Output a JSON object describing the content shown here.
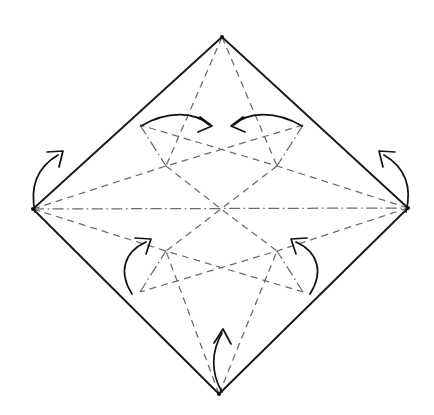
{
  "figure": {
    "kind": "origami-crease-pattern",
    "canvas": {
      "width": 434,
      "height": 415,
      "background": "#ffffff"
    },
    "colors": {
      "outline": "#1a1a1a",
      "crease": "#6b6b6b",
      "arrow": "#111111",
      "background": "#ffffff"
    },
    "line_styles": {
      "outline_label": "solid",
      "valley_label": "dashed",
      "mountain_label": "dash-dot-dot"
    }
  },
  "geometry": {
    "vertices": {
      "top": {
        "name": "top-vertex",
        "x": 222,
        "y": 37
      },
      "right": {
        "name": "right-vertex",
        "x": 408,
        "y": 208
      },
      "bottom": {
        "name": "bottom-vertex",
        "x": 219,
        "y": 394
      },
      "left": {
        "name": "left-vertex",
        "x": 33,
        "y": 209
      },
      "center": {
        "name": "center-point",
        "x": 221,
        "y": 209
      }
    },
    "edge_nodes": {
      "upper_left": {
        "name": "edge-node-upper-left",
        "x": 140,
        "y": 125
      },
      "upper_right": {
        "name": "edge-node-upper-right",
        "x": 303,
        "y": 125
      },
      "lower_left": {
        "name": "edge-node-lower-left",
        "x": 140,
        "y": 292
      },
      "lower_right": {
        "name": "edge-node-lower-right",
        "x": 303,
        "y": 292
      }
    },
    "inner_nodes": {
      "upper_left": {
        "name": "inner-node-upper-left",
        "x": 166,
        "y": 166
      },
      "upper_right": {
        "name": "inner-node-upper-right",
        "x": 277,
        "y": 166
      },
      "lower_left": {
        "name": "inner-node-lower-left",
        "x": 166,
        "y": 251
      },
      "lower_right": {
        "name": "inner-node-lower-right",
        "x": 277,
        "y": 251
      }
    }
  },
  "outline": {
    "name": "sheet-outline",
    "path": "M 222 37 L 408 208 L 219 394 L 33 209 Z"
  },
  "creases": {
    "valley": [
      {
        "name": "valley-top-to-inner-left",
        "path": "M 222 37 L 166 166"
      },
      {
        "name": "valley-top-to-inner-right",
        "path": "M 222 37 L 277 166"
      },
      {
        "name": "valley-bottom-to-inner-left",
        "path": "M 219 394 L 166 251"
      },
      {
        "name": "valley-bottom-to-inner-right",
        "path": "M 219 394 L 277 251"
      },
      {
        "name": "valley-left-upper-diagonal",
        "path": "M 33 209 L 166 166 L 303 125"
      },
      {
        "name": "valley-left-lower-diagonal",
        "path": "M 33 209 L 166 251 L 303 292"
      },
      {
        "name": "valley-right-upper-diagonal",
        "path": "M 408 208 L 277 166 L 140 125"
      },
      {
        "name": "valley-right-lower-diagonal",
        "path": "M 408 208 L 277 251 L 140 292"
      },
      {
        "name": "valley-diagonal-tl-br",
        "path": "M 166 166 L 221 209 L 277 251"
      },
      {
        "name": "valley-diagonal-tr-bl",
        "path": "M 277 166 L 221 209 L 166 251"
      }
    ],
    "mountain": [
      {
        "name": "mountain-horizontal-axis",
        "path": "M 33 209 L 408 208"
      },
      {
        "name": "mountain-edge-upper-left",
        "path": "M 140 125 L 166 166"
      },
      {
        "name": "mountain-edge-upper-right",
        "path": "M 303 125 L 277 166"
      },
      {
        "name": "mountain-edge-lower-left",
        "path": "M 140 292 L 166 251"
      },
      {
        "name": "mountain-edge-lower-right",
        "path": "M 303 292 L 277 251"
      }
    ]
  },
  "arrows": [
    {
      "name": "fold-arrow-top-left",
      "direction": "right",
      "from": "edge-node-upper-left",
      "to": "inner-upper-center",
      "arc": "M 141 126 C 168 110, 196 112, 209 125",
      "head": "M 200 117 L 212 126 L 198 132"
    },
    {
      "name": "fold-arrow-top-right",
      "direction": "left",
      "from": "edge-node-upper-right",
      "to": "inner-upper-center",
      "arc": "M 302 126 C 275 110, 247 112, 234 125",
      "head": "M 243 117 L 231 126 L 245 132"
    },
    {
      "name": "fold-arrow-left",
      "direction": "up-right",
      "from": "left-vertex",
      "to": "upper-left-edge",
      "arc": "M 35 212 C 30 188, 36 168, 58 155",
      "head": "M 47 152 L 63 151 L 59 167"
    },
    {
      "name": "fold-arrow-right",
      "direction": "up-left",
      "from": "right-vertex",
      "to": "upper-right-edge",
      "arc": "M 406 212 C 412 188, 406 168, 384 155",
      "head": "M 395 152 L 379 151 L 383 167"
    },
    {
      "name": "fold-arrow-bottom-left",
      "direction": "up-right",
      "from": "edge-node-lower-left",
      "to": "inner-node-lower-left",
      "arc": "M 132 294 C 118 272, 124 252, 146 242",
      "head": "M 135 238 L 151 239 L 146 254"
    },
    {
      "name": "fold-arrow-bottom-right",
      "direction": "up-left",
      "from": "edge-node-lower-right",
      "to": "inner-node-lower-right",
      "arc": "M 310 294 C 324 272, 318 252, 296 242",
      "head": "M 307 238 L 291 239, L 296 254"
    },
    {
      "name": "fold-arrow-bottom-center",
      "direction": "up",
      "from": "bottom-vertex",
      "to": "center",
      "arc": "M 222 392 C 210 372, 212 350, 222 333",
      "head": "M 214 343 L 223 329 L 231 344"
    }
  ]
}
